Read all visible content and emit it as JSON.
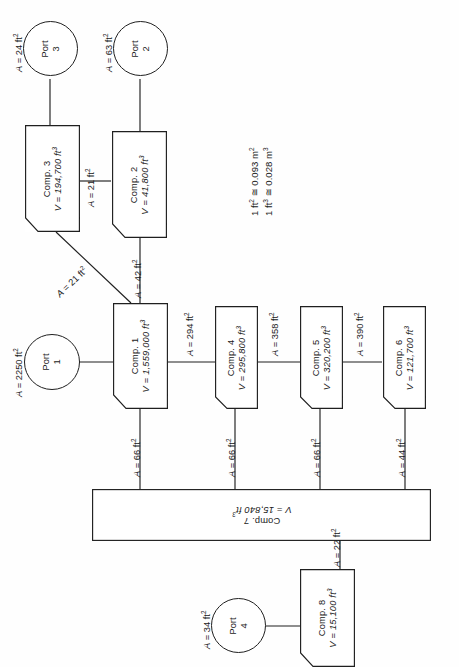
{
  "diagram": {
    "orientation": "rotated-90",
    "line_color": "#1f1f1f",
    "background": "#fefefe"
  },
  "conversion_note": {
    "line1": "1 ft² ≅ 0.093 m²",
    "line2": "1 ft³ ≅ 0.028 m³"
  },
  "ports": [
    {
      "id": "port-1",
      "name": "Port",
      "number": "1",
      "area_label": "A = 2250 ft²"
    },
    {
      "id": "port-2",
      "name": "Port",
      "number": "2",
      "area_label": "A = 63 ft²"
    },
    {
      "id": "port-3",
      "name": "Port",
      "number": "3",
      "area_label": "A = 24 ft²"
    },
    {
      "id": "port-4",
      "name": "Port",
      "number": "4",
      "area_label": "A = 34 ft²"
    }
  ],
  "components": [
    {
      "id": "comp-1",
      "name": "Comp. 1",
      "volume": "V = 1,559,000 ft³"
    },
    {
      "id": "comp-2",
      "name": "Comp. 2",
      "volume": "V = 41,800 ft³"
    },
    {
      "id": "comp-3",
      "name": "Comp. 3",
      "volume": "V = 194,700 ft³"
    },
    {
      "id": "comp-4",
      "name": "Comp. 4",
      "volume": "V = 295,800 ft³"
    },
    {
      "id": "comp-5",
      "name": "Comp. 5",
      "volume": "V = 320,200 ft³"
    },
    {
      "id": "comp-6",
      "name": "Comp. 6",
      "volume": "V = 121,700 ft³"
    },
    {
      "id": "comp-7",
      "name": "Comp. 7",
      "volume": "V = 15,840 ft³"
    },
    {
      "id": "comp-8",
      "name": "Comp. 8",
      "volume": "V = 15,100 ft³"
    }
  ],
  "connections": [
    {
      "id": "conn-3-2",
      "label": "A = 21 ft²",
      "from": "comp-3",
      "to": "comp-2"
    },
    {
      "id": "conn-3-1",
      "label": "A = 21 ft²",
      "from": "comp-3",
      "to": "comp-1"
    },
    {
      "id": "conn-2-1",
      "label": "A = 42 ft²",
      "from": "comp-2",
      "to": "comp-1"
    },
    {
      "id": "conn-1-4",
      "label": "A = 294 ft²",
      "from": "comp-1",
      "to": "comp-4"
    },
    {
      "id": "conn-4-5",
      "label": "A = 358 ft²",
      "from": "comp-4",
      "to": "comp-5"
    },
    {
      "id": "conn-5-6",
      "label": "A = 390 ft²",
      "from": "comp-5",
      "to": "comp-6"
    },
    {
      "id": "conn-1-7",
      "label": "A = 66 ft²",
      "from": "comp-1",
      "to": "comp-7"
    },
    {
      "id": "conn-4-7",
      "label": "A = 66 ft²",
      "from": "comp-4",
      "to": "comp-7"
    },
    {
      "id": "conn-5-7",
      "label": "A = 66 ft²",
      "from": "comp-5",
      "to": "comp-7"
    },
    {
      "id": "conn-6-7",
      "label": "A = 44 ft²",
      "from": "comp-6",
      "to": "comp-7"
    },
    {
      "id": "conn-7-8",
      "label": "A = 22 ft²",
      "from": "comp-7",
      "to": "comp-8"
    }
  ]
}
